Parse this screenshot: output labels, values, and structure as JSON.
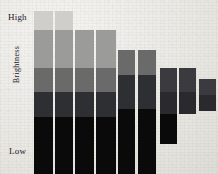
{
  "chart_data": {
    "type": "bar",
    "title": "",
    "subtitle": "",
    "xlabel": "",
    "ylabel": "Brightness",
    "axis_labels": {
      "top": "High",
      "bottom": "Low"
    },
    "grid": false,
    "legend": null,
    "ylim": [
      0,
      100
    ],
    "categories": [
      "1",
      "2",
      "3",
      "4",
      "5",
      "6",
      "7",
      "8",
      "9"
    ],
    "segment_names": [
      "level-1-lightest",
      "level-2",
      "level-3",
      "level-4",
      "level-5-black"
    ],
    "segment_colors": [
      "#cfcecb",
      "#9b9b99",
      "#6a6a6b",
      "#2e2f33",
      "#0a0a0a"
    ],
    "series": [
      {
        "name": "level-1-lightest",
        "values": [
          11,
          11,
          0,
          0,
          0,
          0,
          0,
          0,
          0
        ]
      },
      {
        "name": "level-2",
        "values": [
          22,
          22,
          22,
          22,
          0,
          0,
          0,
          0,
          0
        ]
      },
      {
        "name": "level-3",
        "values": [
          14,
          14,
          14,
          14,
          20,
          20,
          0,
          0,
          0
        ]
      },
      {
        "name": "level-4",
        "values": [
          14,
          14,
          14,
          14,
          20,
          20,
          24,
          23,
          18
        ]
      },
      {
        "name": "level-5-black",
        "values": [
          33,
          33,
          33,
          33,
          41,
          47,
          20,
          0,
          0
        ]
      }
    ],
    "bar_tops_pct": [
      6,
      6,
      17,
      17,
      46,
      46,
      56,
      57,
      63
    ],
    "bar_totals_pct": [
      94,
      94,
      83,
      83,
      81,
      87,
      44,
      23,
      18
    ]
  },
  "bars": [
    {
      "name": "bar-1",
      "x": 36,
      "width": 20,
      "top": 11,
      "segments": [
        {
          "color": "#cfcecb",
          "h": 19
        },
        {
          "color": "#9b9b99",
          "h": 38
        },
        {
          "color": "#6a6a6b",
          "h": 24
        },
        {
          "color": "#2e2f33",
          "h": 25
        },
        {
          "color": "#0a0a0a",
          "h": 57
        }
      ]
    },
    {
      "name": "bar-2",
      "x": 58,
      "width": 20,
      "top": 11,
      "segments": [
        {
          "color": "#cfcecb",
          "h": 19
        },
        {
          "color": "#9b9b99",
          "h": 38
        },
        {
          "color": "#6a6a6b",
          "h": 24
        },
        {
          "color": "#2e2f33",
          "h": 25
        },
        {
          "color": "#0a0a0a",
          "h": 57
        }
      ]
    },
    {
      "name": "bar-3",
      "x": 80,
      "width": 20,
      "top": 30,
      "segments": [
        {
          "color": "#9b9b99",
          "h": 38
        },
        {
          "color": "#6a6a6b",
          "h": 24
        },
        {
          "color": "#2e2f33",
          "h": 25
        },
        {
          "color": "#0a0a0a",
          "h": 57
        }
      ]
    },
    {
      "name": "bar-4",
      "x": 102,
      "width": 21,
      "top": 30,
      "segments": [
        {
          "color": "#9b9b99",
          "h": 38
        },
        {
          "color": "#6a6a6b",
          "h": 24
        },
        {
          "color": "#2e2f33",
          "h": 25
        },
        {
          "color": "#0a0a0a",
          "h": 57
        }
      ]
    },
    {
      "name": "bar-5",
      "x": 126,
      "width": 18,
      "top": 50,
      "segments": [
        {
          "color": "#6a6a6b",
          "h": 25
        },
        {
          "color": "#2e2f33",
          "h": 34
        },
        {
          "color": "#0a0a0a",
          "h": 65
        }
      ]
    },
    {
      "name": "bar-6",
      "x": 147,
      "width": 19,
      "top": 50,
      "segments": [
        {
          "color": "#6a6a6b",
          "h": 25
        },
        {
          "color": "#2e2f33",
          "h": 34
        },
        {
          "color": "#0a0a0a",
          "h": 74
        }
      ]
    },
    {
      "name": "bar-7",
      "x": 170,
      "width": 18,
      "top": 68,
      "segments": [
        {
          "color": "#3b3b3f",
          "h": 24
        },
        {
          "color": "#2a2a2e",
          "h": 22
        },
        {
          "color": "#0a0a0a",
          "h": 30
        }
      ]
    },
    {
      "name": "bar-8",
      "x": 190,
      "width": 18,
      "top": 68,
      "segments": [
        {
          "color": "#3b3b3f",
          "h": 24
        },
        {
          "color": "#2a2a2e",
          "h": 22
        }
      ]
    },
    {
      "name": "bar-9",
      "x": 212,
      "width": 18,
      "top": 79,
      "segments": [
        {
          "color": "#3b3b3f",
          "h": 16
        },
        {
          "color": "#2a2a2e",
          "h": 16
        }
      ]
    }
  ]
}
